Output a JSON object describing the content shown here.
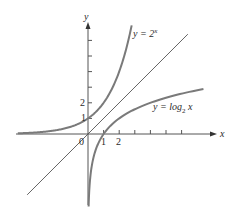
{
  "chart_data": {
    "type": "line",
    "title": "",
    "xlabel": "x",
    "ylabel": "y",
    "x_tick_labels": [
      "0",
      "1",
      "2"
    ],
    "y_tick_labels": [
      "1",
      "2"
    ],
    "x_ticks": [
      1,
      2,
      3,
      4,
      5,
      6
    ],
    "y_ticks": [
      1,
      2,
      3,
      4,
      5,
      6
    ],
    "xlim": [
      -4.6,
      8.3
    ],
    "ylim": [
      -4.5,
      7.1
    ],
    "grid": false,
    "series": [
      {
        "name": "y = 2^x",
        "function": "2^x",
        "x": [
          -4.5,
          -3,
          -2,
          -1,
          0,
          1,
          2,
          2.8
        ],
        "y": [
          0.04,
          0.125,
          0.25,
          0.5,
          1,
          2,
          4,
          7
        ]
      },
      {
        "name": "y = x",
        "function": "x",
        "x": [
          -3.9,
          6.4
        ],
        "y": [
          -3.9,
          6.4
        ]
      },
      {
        "name": "y = log2 x",
        "function": "log2(x)",
        "x": [
          0.04,
          0.125,
          0.25,
          0.5,
          1,
          2,
          4,
          7.4
        ],
        "y": [
          -4.5,
          -3,
          -2,
          -1,
          0,
          1,
          2,
          2.9
        ]
      }
    ]
  },
  "labels": {
    "y_axis": "y",
    "x_axis": "x",
    "origin": "0",
    "x_tick_1": "1",
    "x_tick_2": "2",
    "y_tick_1": "1",
    "y_tick_2": "2",
    "exp_prefix": "y = 2",
    "exp_sup": "x",
    "log_prefix": "y = log",
    "log_sub": "2",
    "log_suffix": " x"
  },
  "colors": {
    "curve": "#7a7a7a",
    "axis": "#555555",
    "line": "#555555"
  }
}
